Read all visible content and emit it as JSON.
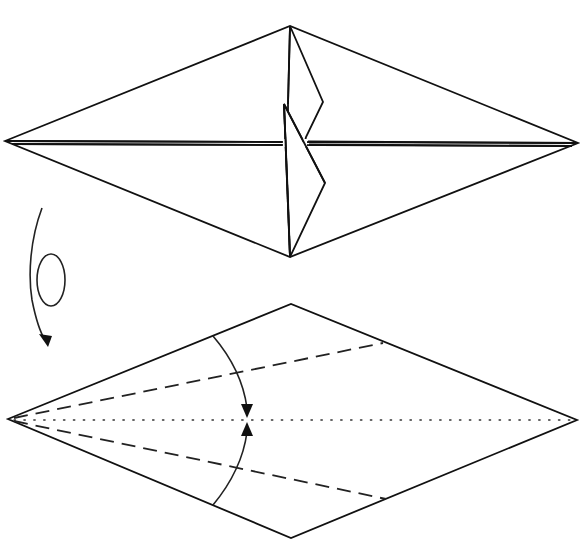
{
  "diagram": {
    "type": "origami-instruction",
    "steps": [
      {
        "id": "step-top",
        "description": "Folded kite base with inner flaps",
        "outline": {
          "left": [
            5,
            141
          ],
          "top": [
            290,
            26
          ],
          "right": [
            578,
            143
          ],
          "bottom": [
            290,
            257
          ]
        },
        "elements": [
          "diamond-outline",
          "double-center-line",
          "upper-inner-flap",
          "lower-inner-flap"
        ]
      },
      {
        "id": "turn-over",
        "description": "Turn the model over",
        "symbol": "turn-over-arrow"
      },
      {
        "id": "step-bottom",
        "description": "Valley fold both edges to the center line",
        "outline": {
          "left": [
            8,
            419
          ],
          "top": [
            291,
            304
          ],
          "right": [
            577,
            420
          ],
          "bottom": [
            291,
            538
          ]
        },
        "elements": [
          "diamond-outline",
          "dotted-center-line",
          "valley-fold-upper",
          "valley-fold-lower",
          "fold-arrow-upper",
          "fold-arrow-lower"
        ]
      }
    ],
    "line_styles": {
      "edge": "solid",
      "valley_fold": "dashed",
      "existing_crease": "dotted"
    },
    "colors": {
      "line": "#111111",
      "background": "#ffffff"
    }
  }
}
